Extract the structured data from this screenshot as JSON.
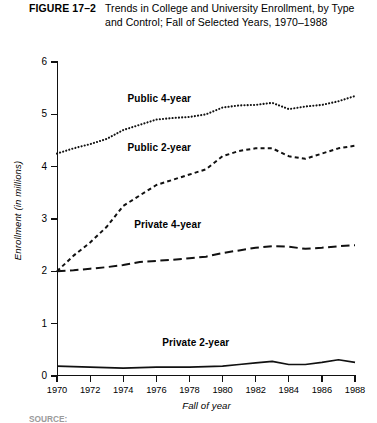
{
  "caption": {
    "figure_number": "FIGURE 17–2",
    "title": "Trends in College and University Enrollment, by Type and Control; Fall of Selected Years, 1970–1988"
  },
  "source_note": "SOURCE:",
  "chart_data": {
    "type": "line",
    "title": "Trends in College and University Enrollment, by Type and Control; Fall of Selected Years, 1970–1988",
    "xlabel": "Fall of year",
    "ylabel": "Enrollment (in millions)",
    "xlim": [
      1970,
      1988
    ],
    "ylim": [
      0,
      6
    ],
    "yticks": [
      0,
      1,
      2,
      3,
      4,
      5,
      6
    ],
    "xticks": [
      1970,
      1972,
      1974,
      1976,
      1978,
      1980,
      1982,
      1984,
      1986,
      1988
    ],
    "grid": false,
    "legend": "inline-labels",
    "x": [
      1970,
      1971,
      1972,
      1973,
      1974,
      1975,
      1976,
      1977,
      1978,
      1979,
      1980,
      1981,
      1982,
      1983,
      1984,
      1985,
      1986,
      1987,
      1988
    ],
    "series": [
      {
        "name": "Public 4-year",
        "style": "dotted",
        "values": [
          4.25,
          4.35,
          4.43,
          4.53,
          4.7,
          4.8,
          4.9,
          4.93,
          4.95,
          5.0,
          5.13,
          5.17,
          5.18,
          5.22,
          5.1,
          5.15,
          5.18,
          5.25,
          5.35
        ]
      },
      {
        "name": "Public 2-year",
        "style": "short-dash",
        "values": [
          2.0,
          2.3,
          2.55,
          2.85,
          3.25,
          3.45,
          3.65,
          3.75,
          3.85,
          3.95,
          4.2,
          4.3,
          4.35,
          4.35,
          4.2,
          4.15,
          4.25,
          4.35,
          4.4
        ]
      },
      {
        "name": "Private 4-year",
        "style": "long-dash",
        "values": [
          2.0,
          2.02,
          2.05,
          2.08,
          2.12,
          2.18,
          2.2,
          2.22,
          2.25,
          2.28,
          2.35,
          2.4,
          2.45,
          2.48,
          2.47,
          2.43,
          2.45,
          2.48,
          2.5
        ]
      },
      {
        "name": "Private 2-year",
        "style": "solid",
        "values": [
          0.19,
          0.18,
          0.17,
          0.16,
          0.15,
          0.16,
          0.17,
          0.17,
          0.17,
          0.18,
          0.19,
          0.22,
          0.25,
          0.28,
          0.22,
          0.22,
          0.26,
          0.31,
          0.26
        ]
      }
    ],
    "inline_labels": [
      {
        "name": "Public 4-year",
        "x": 1974.2,
        "y": 5.3
      },
      {
        "name": "Public 2-year",
        "x": 1974.2,
        "y": 4.35
      },
      {
        "name": "Private 4-year",
        "x": 1974.6,
        "y": 2.88
      },
      {
        "name": "Private 2-year",
        "x": 1976.3,
        "y": 0.63
      }
    ]
  }
}
